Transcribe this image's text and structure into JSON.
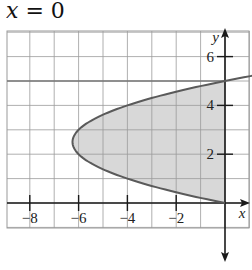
{
  "title": {
    "var": "x",
    "rest": " = 0"
  },
  "colors": {
    "grid": "#9a9a9a",
    "axis": "#1a1a1a",
    "curve": "#5a5a5a",
    "fill": "#d8d8d8"
  },
  "chart_data": {
    "type": "line",
    "title": "x = 0",
    "xlabel": "x",
    "ylabel": "y",
    "xlim": [
      -9,
      1
    ],
    "ylim": [
      -1,
      7
    ],
    "xticks": [
      -8,
      -6,
      -4,
      -2
    ],
    "xtick_labels": [
      "−8",
      "−6",
      "−4",
      "−2"
    ],
    "yticks": [
      2,
      4,
      6
    ],
    "ytick_labels": [
      "2",
      "4",
      "6"
    ],
    "grid": true,
    "series": [
      {
        "name": "x = y^2 - 5y",
        "points": [
          [
            0,
            0
          ],
          [
            -2.25,
            0.5
          ],
          [
            -4,
            1
          ],
          [
            -5.25,
            1.5
          ],
          [
            -6,
            2
          ],
          [
            -6.25,
            2.5
          ],
          [
            -6,
            3
          ],
          [
            -5.25,
            3.5
          ],
          [
            -4,
            4
          ],
          [
            -2.25,
            4.5
          ],
          [
            0,
            5
          ],
          [
            2.75,
            5.5
          ]
        ]
      },
      {
        "name": "shaded region",
        "description": "region between curve x = y^2 - 5y and the y-axis (x = 0), 0 ≤ y ≤ 5"
      }
    ],
    "horizontal_line": {
      "y": 5
    }
  }
}
